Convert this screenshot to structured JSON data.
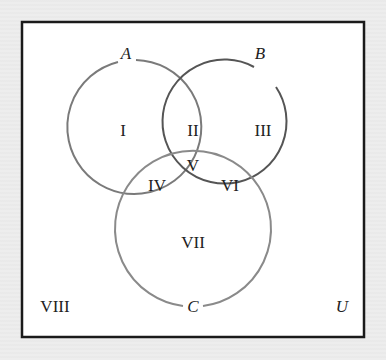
{
  "diagram": {
    "type": "venn",
    "universe_label": "U",
    "sets": [
      {
        "name": "A",
        "label": "A",
        "color": "#7a7a7a"
      },
      {
        "name": "B",
        "label": "B",
        "color": "#555555"
      },
      {
        "name": "C",
        "label": "C",
        "color": "#8a8a8a"
      }
    ],
    "regions": [
      {
        "id": "I",
        "label": "I",
        "membership": "A only"
      },
      {
        "id": "II",
        "label": "II",
        "membership": "A and B only"
      },
      {
        "id": "III",
        "label": "III",
        "membership": "B only"
      },
      {
        "id": "IV",
        "label": "IV",
        "membership": "A and C only"
      },
      {
        "id": "V",
        "label": "V",
        "membership": "A, B and C"
      },
      {
        "id": "VI",
        "label": "VI",
        "membership": "B and C only"
      },
      {
        "id": "VII",
        "label": "VII",
        "membership": "C only"
      },
      {
        "id": "VIII",
        "label": "VIII",
        "membership": "outside A, B, C"
      }
    ]
  }
}
